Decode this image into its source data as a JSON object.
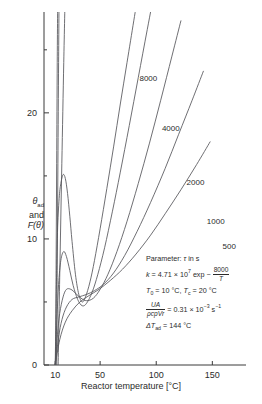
{
  "chart_data": {
    "type": "line",
    "title": "",
    "xlabel": "Reactor temperature [°C]",
    "ylabel": "θad and F(θ)",
    "ylabel_parts": {
      "main": "θ",
      "sub": "ad",
      "and": "and",
      "second": "F(θ)"
    },
    "xlim": [
      0,
      180
    ],
    "ylim": [
      0,
      28
    ],
    "xticks": [
      10,
      50,
      100,
      150
    ],
    "xtick_labels": [
      "10",
      "50",
      "100",
      "150"
    ],
    "yticks": [
      0,
      10,
      20
    ],
    "ytick_labels": [
      "0",
      "10",
      "20"
    ],
    "yminor_ticks": [
      5,
      15,
      25
    ],
    "grid": false,
    "legend_position": "inline-curve-labels",
    "series": [
      {
        "name": "8000",
        "label": "8000",
        "label_x": 93,
        "label_y": 22.5,
        "points": [
          [
            10,
            0
          ],
          [
            11,
            6
          ],
          [
            12,
            10.5
          ],
          [
            13.5,
            13.2
          ],
          [
            15,
            14.4
          ],
          [
            17,
            15.1
          ],
          [
            19,
            14.8
          ],
          [
            21,
            13.6
          ],
          [
            23,
            11.8
          ],
          [
            25,
            9.8
          ],
          [
            28,
            7.2
          ],
          [
            31,
            5.6
          ],
          [
            34,
            5.0
          ],
          [
            37,
            5.4
          ],
          [
            41,
            6.6
          ],
          [
            45,
            8.3
          ],
          [
            50,
            10.8
          ],
          [
            56,
            14.0
          ],
          [
            62,
            17.3
          ],
          [
            68,
            20.7
          ],
          [
            74,
            24.0
          ],
          [
            80,
            27.3
          ],
          [
            84,
            29.5
          ]
        ]
      },
      {
        "name": "4000",
        "label": "4000",
        "label_x": 113,
        "label_y": 18.6,
        "points": [
          [
            10,
            0
          ],
          [
            11.5,
            3.6
          ],
          [
            13,
            6.4
          ],
          [
            15,
            8.3
          ],
          [
            17.5,
            9.0
          ],
          [
            20,
            8.6
          ],
          [
            23,
            7.5
          ],
          [
            26,
            6.3
          ],
          [
            30,
            5.2
          ],
          [
            34,
            4.7
          ],
          [
            38,
            4.9
          ],
          [
            43,
            5.8
          ],
          [
            48,
            7.2
          ],
          [
            54,
            9.3
          ],
          [
            61,
            12.2
          ],
          [
            68,
            15.3
          ],
          [
            76,
            19.0
          ],
          [
            84,
            22.8
          ],
          [
            92,
            26.6
          ],
          [
            99,
            29.9
          ]
        ]
      },
      {
        "name": "2000",
        "label": "2000",
        "label_x": 135,
        "label_y": 14.3,
        "points": [
          [
            10,
            0
          ],
          [
            12,
            2.4
          ],
          [
            14,
            4.1
          ],
          [
            17,
            5.4
          ],
          [
            20,
            6.0
          ],
          [
            24,
            6.0
          ],
          [
            28,
            5.7
          ],
          [
            33,
            5.3
          ],
          [
            38,
            5.1
          ],
          [
            44,
            5.3
          ],
          [
            50,
            6.0
          ],
          [
            57,
            7.2
          ],
          [
            65,
            9.0
          ],
          [
            74,
            11.4
          ],
          [
            84,
            14.4
          ],
          [
            94,
            17.6
          ],
          [
            104,
            21.0
          ],
          [
            114,
            24.5
          ],
          [
            122,
            27.3
          ]
        ]
      },
      {
        "name": "1000",
        "label": "1000",
        "label_x": 153,
        "label_y": 11.2,
        "points": [
          [
            10,
            0
          ],
          [
            13,
            2.2
          ],
          [
            16,
            3.6
          ],
          [
            20,
            4.6
          ],
          [
            25,
            5.2
          ],
          [
            31,
            5.4
          ],
          [
            38,
            5.6
          ],
          [
            45,
            5.9
          ],
          [
            53,
            6.4
          ],
          [
            62,
            7.3
          ],
          [
            72,
            8.7
          ],
          [
            83,
            10.6
          ],
          [
            95,
            12.9
          ],
          [
            108,
            15.6
          ],
          [
            120,
            18.3
          ],
          [
            132,
            21.0
          ],
          [
            142,
            23.3
          ]
        ]
      },
      {
        "name": "500",
        "label": "500",
        "label_x": 165,
        "label_y": 9.2,
        "points": [
          [
            10,
            0
          ],
          [
            14,
            2.0
          ],
          [
            19,
            3.4
          ],
          [
            25,
            4.3
          ],
          [
            32,
            5.0
          ],
          [
            40,
            5.5
          ],
          [
            49,
            6.0
          ],
          [
            59,
            6.7
          ],
          [
            70,
            7.6
          ],
          [
            82,
            8.8
          ],
          [
            95,
            10.3
          ],
          [
            108,
            12.0
          ],
          [
            122,
            13.9
          ],
          [
            136,
            15.9
          ],
          [
            148,
            17.7
          ]
        ]
      },
      {
        "name": "F-line-a",
        "label": "",
        "label_x": null,
        "label_y": null,
        "points": [
          [
            10.4,
            0
          ],
          [
            10.8,
            8
          ],
          [
            11.3,
            16
          ],
          [
            11.8,
            24
          ],
          [
            12.3,
            30
          ]
        ]
      },
      {
        "name": "F-line-b",
        "label": "",
        "label_x": null,
        "label_y": null,
        "points": [
          [
            11.3,
            0
          ],
          [
            11.8,
            8
          ],
          [
            12.4,
            16
          ],
          [
            13.0,
            24
          ],
          [
            13.5,
            30
          ]
        ]
      },
      {
        "name": "F-line-c",
        "label": "",
        "label_x": null,
        "label_y": null,
        "points": [
          [
            12.6,
            0
          ],
          [
            14.2,
            8
          ],
          [
            15.9,
            16
          ],
          [
            17.6,
            24
          ],
          [
            19.0,
            30
          ]
        ]
      }
    ],
    "annotations": {
      "title": "Parameter:",
      "parameter_symbol": "τ",
      "parameter_units": "in s",
      "lines": [
        {
          "id": "rate-constant",
          "text": "k = 4.71 × 10⁷ exp − 8000/T"
        },
        {
          "id": "temperatures",
          "text": "T₀ = 10 °C, Tc = 20 °C"
        },
        {
          "id": "heat-transfer",
          "text": "UA/(ρcpVr) = 0.31 × 10⁻³ s⁻¹"
        },
        {
          "id": "adiabatic-rise",
          "text": "ΔTad = 144 °C"
        }
      ],
      "rate_constant": {
        "symbol": "k",
        "equals": "=",
        "prefactor": "4.71 × 10",
        "prefactor_exp": "7",
        "exp_text": "exp −",
        "frac_num": "8000",
        "frac_den": "T"
      },
      "temperatures": {
        "t0_symbol": "T",
        "t0_sub": "0",
        "t0_value": "= 10 °C,",
        "tc_symbol": "T",
        "tc_sub": "c",
        "tc_value": "= 20 °C"
      },
      "heat_transfer": {
        "frac_num": "UA",
        "frac_den": "ρcpVr",
        "equals": "=",
        "value": "0.31 × 10",
        "value_exp": "−3",
        "unit": "s",
        "unit_exp": "−1"
      },
      "adiabatic": {
        "symbol": "ΔT",
        "sub": "ad",
        "value": "= 144 °C"
      }
    }
  }
}
